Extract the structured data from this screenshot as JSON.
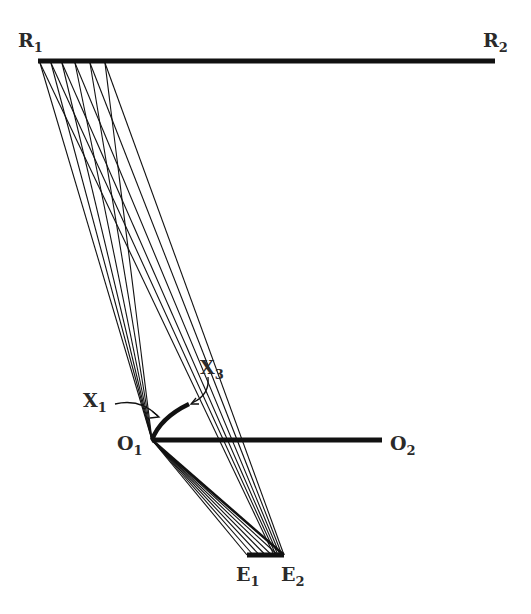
{
  "diagram": {
    "type": "ray-geometry",
    "labels": {
      "R1": {
        "main": "R",
        "sub": "1"
      },
      "R2": {
        "main": "R",
        "sub": "2"
      },
      "O1": {
        "main": "O",
        "sub": "1"
      },
      "O2": {
        "main": "O",
        "sub": "2"
      },
      "E1": {
        "main": "E",
        "sub": "1"
      },
      "E2": {
        "main": "E",
        "sub": "2"
      },
      "X1": {
        "main": "X",
        "sub": "1"
      },
      "X3": {
        "main": "X",
        "sub": "3"
      }
    },
    "points": {
      "R1": [
        38,
        61
      ],
      "R2": [
        495,
        61
      ],
      "O1": [
        152,
        440
      ],
      "O2": [
        382,
        440
      ],
      "E1": [
        247,
        555
      ],
      "E2": [
        284,
        555
      ],
      "X1": [
        163,
        420
      ],
      "X3": [
        187,
        406
      ]
    },
    "ray_origins_on_R": [
      40,
      51,
      62,
      75,
      90,
      105
    ],
    "colors": {
      "ink": "#111111",
      "label": "#2a2a2a",
      "background": "#ffffff"
    }
  }
}
